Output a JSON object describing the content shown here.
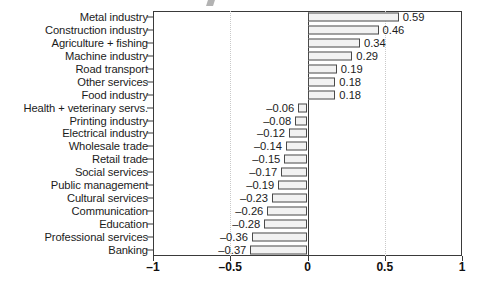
{
  "chart_data": {
    "type": "bar",
    "orientation": "horizontal",
    "title": "",
    "xlabel": "",
    "ylabel": "",
    "xlim": [
      -1,
      1
    ],
    "xticks": [
      -1,
      -0.5,
      0,
      0.5,
      1
    ],
    "xtick_labels": [
      "–1",
      "–0.5",
      "0",
      "0.5",
      "1"
    ],
    "grid": "dotted vertical gridlines at -0.5 and 0.5",
    "legend": "none",
    "zero_line": true,
    "categories": [
      "Metal industry",
      "Construction industry",
      "Agriculture + fishing",
      "Machine industry",
      "Road transport",
      "Other services",
      "Food industry",
      "Health + veterinary servs.",
      "Printing industry",
      "Electrical industry",
      "Wholesale trade",
      "Retail trade",
      "Social services",
      "Public management",
      "Cultural services",
      "Communication",
      "Education",
      "Professional services",
      "Banking"
    ],
    "values": [
      0.59,
      0.46,
      0.34,
      0.29,
      0.19,
      0.18,
      0.18,
      -0.06,
      -0.08,
      -0.12,
      -0.14,
      -0.15,
      -0.17,
      -0.19,
      -0.23,
      -0.26,
      -0.28,
      -0.36,
      -0.37
    ],
    "value_labels": [
      "0.59",
      "0.46",
      "0.34",
      "0.29",
      "0.19",
      "0.18",
      "0.18",
      "–0.06",
      "–0.08",
      "–0.12",
      "–0.14",
      "–0.15",
      "–0.17",
      "–0.19",
      "–0.23",
      "–0.26",
      "–0.28",
      "–0.36",
      "–0.37"
    ]
  },
  "style": {
    "bar_fill": "#f2f2f2",
    "bar_border": "#4a4a4a",
    "axis_color": "#3a3a3a",
    "grid_color": "#c9c9c9",
    "text_color": "#1b1b1b",
    "background": "#ffffff"
  }
}
